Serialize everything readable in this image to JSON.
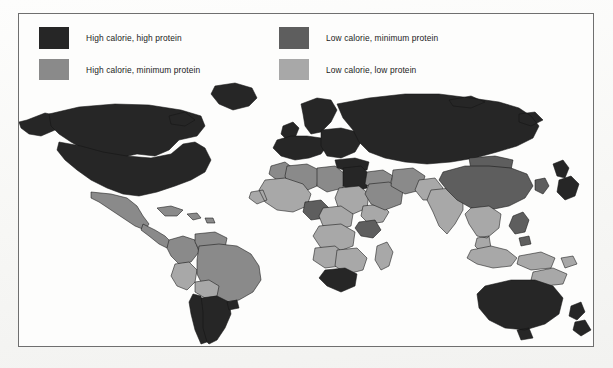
{
  "figure": {
    "type": "choropleth-world-map",
    "frame": true,
    "background_color": "#fbfbfa"
  },
  "legend": {
    "columns": [
      {
        "items": [
          {
            "label": "High calorie, high protein",
            "color": "#262626",
            "key": "high-cal-high-protein"
          },
          {
            "label": "High calorie, minimum protein",
            "color": "#8a8a8a",
            "key": "high-cal-min-protein"
          }
        ]
      },
      {
        "items": [
          {
            "label": "Low calorie, minimum protein",
            "color": "#5e5e5e",
            "key": "low-cal-min-protein"
          },
          {
            "label": "Low calorie, low protein",
            "color": "#a8a8a8",
            "key": "low-cal-low-protein"
          }
        ]
      }
    ]
  },
  "map_data": {
    "categories": [
      {
        "key": "high-cal-high-protein",
        "label": "High calorie, high protein",
        "color": "#262626"
      },
      {
        "key": "high-cal-min-protein",
        "label": "High calorie, minimum protein",
        "color": "#8a8a8a"
      },
      {
        "key": "low-cal-min-protein",
        "label": "Low calorie, minimum protein",
        "color": "#5e5e5e"
      },
      {
        "key": "low-cal-low-protein",
        "label": "Low calorie, low protein",
        "color": "#a8a8a8"
      }
    ],
    "regions": [
      {
        "name": "Alaska",
        "category": "high-cal-high-protein"
      },
      {
        "name": "Canada",
        "category": "high-cal-high-protein"
      },
      {
        "name": "United States",
        "category": "high-cal-high-protein"
      },
      {
        "name": "Greenland",
        "category": "high-cal-high-protein"
      },
      {
        "name": "Mexico",
        "category": "high-cal-min-protein"
      },
      {
        "name": "Central America",
        "category": "high-cal-min-protein"
      },
      {
        "name": "Caribbean",
        "category": "high-cal-min-protein"
      },
      {
        "name": "Colombia",
        "category": "high-cal-min-protein"
      },
      {
        "name": "Venezuela",
        "category": "high-cal-min-protein"
      },
      {
        "name": "Peru",
        "category": "low-cal-low-protein"
      },
      {
        "name": "Brazil",
        "category": "high-cal-min-protein"
      },
      {
        "name": "Bolivia",
        "category": "low-cal-low-protein"
      },
      {
        "name": "Argentina",
        "category": "high-cal-high-protein"
      },
      {
        "name": "Chile",
        "category": "high-cal-high-protein"
      },
      {
        "name": "Uruguay",
        "category": "high-cal-high-protein"
      },
      {
        "name": "Western Europe",
        "category": "high-cal-high-protein"
      },
      {
        "name": "Eastern Europe",
        "category": "high-cal-high-protein"
      },
      {
        "name": "Scandinavia",
        "category": "high-cal-high-protein"
      },
      {
        "name": "United Kingdom",
        "category": "high-cal-high-protein"
      },
      {
        "name": "Soviet Union",
        "category": "high-cal-high-protein"
      },
      {
        "name": "Turkey",
        "category": "high-cal-high-protein"
      },
      {
        "name": "Morocco",
        "category": "high-cal-min-protein"
      },
      {
        "name": "Algeria",
        "category": "high-cal-min-protein"
      },
      {
        "name": "Libya",
        "category": "high-cal-min-protein"
      },
      {
        "name": "Egypt",
        "category": "high-cal-high-protein"
      },
      {
        "name": "Sudan",
        "category": "low-cal-low-protein"
      },
      {
        "name": "West Africa",
        "category": "low-cal-low-protein"
      },
      {
        "name": "Nigeria",
        "category": "low-cal-min-protein"
      },
      {
        "name": "Ethiopia",
        "category": "low-cal-low-protein"
      },
      {
        "name": "Central Africa",
        "category": "low-cal-low-protein"
      },
      {
        "name": "Kenya",
        "category": "low-cal-min-protein"
      },
      {
        "name": "Angola",
        "category": "low-cal-low-protein"
      },
      {
        "name": "Zaire",
        "category": "low-cal-low-protein"
      },
      {
        "name": "Madagascar",
        "category": "low-cal-low-protein"
      },
      {
        "name": "South Africa",
        "category": "high-cal-high-protein"
      },
      {
        "name": "Saudi Arabia",
        "category": "high-cal-min-protein"
      },
      {
        "name": "Middle East",
        "category": "high-cal-min-protein"
      },
      {
        "name": "Iran",
        "category": "high-cal-min-protein"
      },
      {
        "name": "India",
        "category": "low-cal-low-protein"
      },
      {
        "name": "Pakistan",
        "category": "low-cal-low-protein"
      },
      {
        "name": "China",
        "category": "low-cal-min-protein"
      },
      {
        "name": "Mongolia",
        "category": "low-cal-min-protein"
      },
      {
        "name": "Southeast Asia",
        "category": "low-cal-low-protein"
      },
      {
        "name": "Indonesia",
        "category": "low-cal-low-protein"
      },
      {
        "name": "Philippines",
        "category": "low-cal-min-protein"
      },
      {
        "name": "Japan",
        "category": "high-cal-high-protein"
      },
      {
        "name": "Korea",
        "category": "low-cal-min-protein"
      },
      {
        "name": "Papua New Guinea",
        "category": "low-cal-low-protein"
      },
      {
        "name": "Australia",
        "category": "high-cal-high-protein"
      },
      {
        "name": "New Zealand",
        "category": "high-cal-high-protein"
      }
    ]
  }
}
